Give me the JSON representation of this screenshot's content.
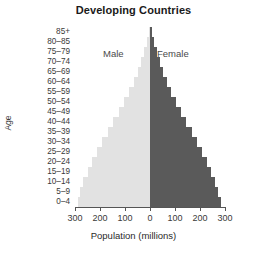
{
  "chart_data": {
    "type": "bar",
    "subtype": "population-pyramid",
    "title": "Developing Countries",
    "xlabel": "Population (millions)",
    "ylabel": "Age",
    "grid": false,
    "legend_position": "inside-top",
    "xlim": [
      -300,
      300
    ],
    "xticks": [
      -300,
      -200,
      -100,
      0,
      100,
      200,
      300
    ],
    "xtick_labels": [
      "300",
      "200",
      "100",
      "0",
      "100",
      "200",
      "300"
    ],
    "categories": [
      "0–4",
      "5–9",
      "10–14",
      "15–19",
      "20–24",
      "25–29",
      "30–34",
      "35–39",
      "40–44",
      "45–49",
      "50–54",
      "55–59",
      "60–64",
      "65–69",
      "70–74",
      "75–79",
      "80–85",
      "85+"
    ],
    "series": [
      {
        "name": "Male",
        "color": "#e2e2e2",
        "side": "left",
        "values": [
          290,
          280,
          268,
          250,
          232,
          212,
          192,
          170,
          148,
          126,
          104,
          84,
          66,
          50,
          36,
          24,
          13,
          5
        ]
      },
      {
        "name": "Female",
        "color": "#5a5a5a",
        "side": "right",
        "values": [
          282,
          272,
          260,
          243,
          226,
          207,
          188,
          166,
          145,
          124,
          103,
          84,
          67,
          52,
          38,
          26,
          15,
          7
        ]
      }
    ]
  },
  "labels": {
    "male": "Male",
    "female": "Female"
  },
  "footer": {
    "note": ""
  }
}
